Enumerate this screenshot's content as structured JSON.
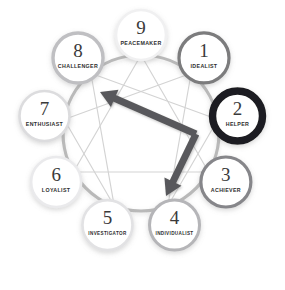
{
  "diagram": {
    "type": "enneagram",
    "background_color": "#ffffff",
    "center": {
      "x": 141,
      "y": 133
    },
    "wheel_radius": 78,
    "wheel_stroke_color": "#b9b9b9",
    "inner_line_color": "#d3d3d3",
    "node_fill": "#ffffff",
    "node_radius": 25,
    "node_orbit_radius": 98,
    "selected_type": "2",
    "arrow": {
      "name": "connection-arrow",
      "color": "#59595b",
      "style": "double-headed-bent",
      "from_head_points_to": "8",
      "to_head_points_to": "4",
      "vertex_near_type": "2"
    },
    "nodes": [
      {
        "id": "1",
        "number": "1",
        "label": "IDEALIST",
        "angle_deg": -50,
        "ring_color": "#7b7b7d",
        "ring_width": 3.2,
        "selected": false
      },
      {
        "id": "2",
        "number": "2",
        "label": "HELPER",
        "angle_deg": -10,
        "ring_color": "#1e1e20",
        "ring_width": 7.5,
        "selected": true
      },
      {
        "id": "3",
        "number": "3",
        "label": "ACHIEVER",
        "angle_deg": 30,
        "ring_color": "#86868a",
        "ring_width": 3.2,
        "selected": false
      },
      {
        "id": "4",
        "number": "4",
        "label": "INDIVIDUALIST",
        "angle_deg": 70,
        "ring_color": "#b5b5b8",
        "ring_width": 3.0,
        "selected": false
      },
      {
        "id": "5",
        "number": "5",
        "label": "INVESTIGATOR",
        "angle_deg": 110,
        "ring_color": "#e2e2e4",
        "ring_width": 2.6,
        "selected": false
      },
      {
        "id": "6",
        "number": "6",
        "label": "LOYALIST",
        "angle_deg": 150,
        "ring_color": "#eaeaec",
        "ring_width": 2.6,
        "selected": false
      },
      {
        "id": "7",
        "number": "7",
        "label": "ENTHUSIAST",
        "angle_deg": 190,
        "ring_color": "#dcdcde",
        "ring_width": 2.6,
        "selected": false
      },
      {
        "id": "8",
        "number": "8",
        "label": "CHALLENGER",
        "angle_deg": 230,
        "ring_color": "#bfbfc2",
        "ring_width": 3.4,
        "selected": false
      },
      {
        "id": "9",
        "number": "9",
        "label": "PEACEMAKER",
        "angle_deg": 270,
        "ring_color": "#f0f0f1",
        "ring_width": 2.6,
        "selected": false
      }
    ],
    "inner_triangle": [
      "9",
      "3",
      "6"
    ],
    "inner_hexad": [
      "1",
      "4",
      "2",
      "8",
      "5",
      "7"
    ]
  }
}
